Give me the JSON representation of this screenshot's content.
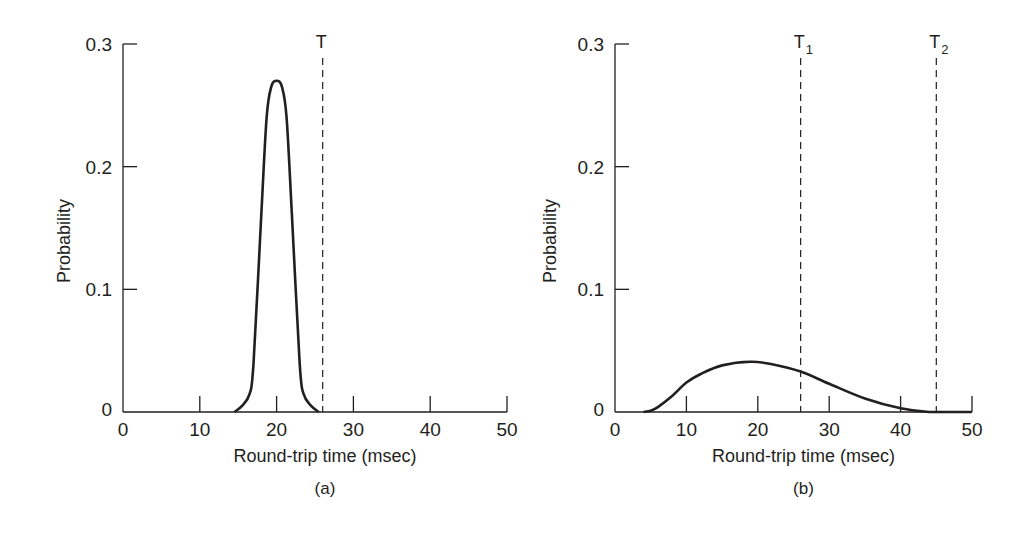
{
  "chart_data": [
    {
      "type": "line",
      "panel": "a",
      "caption": "(a)",
      "title": "",
      "xlabel": "Round-trip time (msec)",
      "ylabel": "Probability",
      "xlim": [
        0,
        50
      ],
      "ylim": [
        0,
        0.3
      ],
      "x_ticks": [
        "0",
        "10",
        "20",
        "30",
        "40",
        "50"
      ],
      "y_ticks": [
        "0",
        "0.1",
        "0.2",
        "0.3"
      ],
      "grid": false,
      "series": [
        {
          "name": "RTT distribution",
          "x": [
            14.5,
            15.5,
            16.5,
            17,
            18,
            18.7,
            19.3,
            20,
            20.7,
            21.3,
            22,
            23,
            23.5,
            24.5,
            25.5
          ],
          "values": [
            0,
            0.005,
            0.015,
            0.04,
            0.16,
            0.24,
            0.265,
            0.27,
            0.265,
            0.24,
            0.16,
            0.04,
            0.015,
            0.005,
            0
          ]
        }
      ],
      "markers": [
        {
          "label": "T",
          "x": 26,
          "style": "dashed"
        }
      ]
    },
    {
      "type": "line",
      "panel": "b",
      "caption": "(b)",
      "title": "",
      "xlabel": "Round-trip time (msec)",
      "ylabel": "Probability",
      "xlim": [
        0,
        50
      ],
      "ylim": [
        0,
        0.3
      ],
      "x_ticks": [
        "0",
        "10",
        "20",
        "30",
        "40",
        "50"
      ],
      "y_ticks": [
        "0",
        "0.1",
        "0.2",
        "0.3"
      ],
      "grid": false,
      "series": [
        {
          "name": "RTT distribution",
          "x": [
            4,
            5,
            6,
            8,
            10,
            12,
            15,
            19,
            22,
            26,
            30,
            35,
            40,
            44,
            50
          ],
          "values": [
            0,
            0.001,
            0.004,
            0.013,
            0.024,
            0.031,
            0.038,
            0.041,
            0.039,
            0.033,
            0.023,
            0.011,
            0.003,
            0,
            0
          ]
        }
      ],
      "markers": [
        {
          "label": "T",
          "subscript": "1",
          "x": 26,
          "style": "dashed"
        },
        {
          "label": "T",
          "subscript": "2",
          "x": 45,
          "style": "dashed"
        }
      ]
    }
  ]
}
